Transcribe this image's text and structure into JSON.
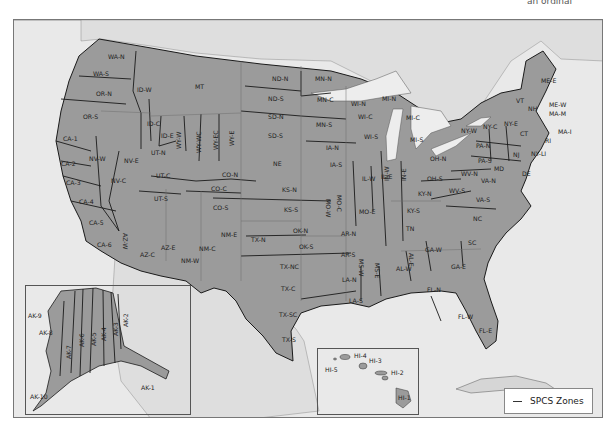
{
  "top_fragment_text": "an ordinal",
  "colors": {
    "land_us": "#9b9b9b",
    "land_foreign": "#d9d9d9",
    "water": "#e9e9e9",
    "lakes": "#efefef",
    "zone_border": "#1a1a1a",
    "state_border": "#6e6e6e"
  },
  "legend": {
    "label": "SPCS Zones"
  },
  "zones": {
    "northwest": [
      "WA-N",
      "WA-S",
      "OR-N",
      "OR-S",
      "ID-W",
      "ID-C",
      "ID-E",
      "MT"
    ],
    "california_nevada": [
      "CA-1",
      "CA-2",
      "CA-3",
      "CA-4",
      "CA-5",
      "CA-6",
      "NV-W",
      "NV-C",
      "NV-E"
    ],
    "mountain": [
      "UT-N",
      "UT-C",
      "UT-S",
      "WY-W",
      "WY-WC",
      "WY-EC",
      "WY-E",
      "CO-N",
      "CO-C",
      "CO-S",
      "AZ-W",
      "AZ-C",
      "AZ-E",
      "NM-W",
      "NM-C",
      "NM-E"
    ],
    "plains": [
      "ND-N",
      "ND-S",
      "SD-N",
      "SD-S",
      "NE",
      "KS-N",
      "KS-S",
      "OK-N",
      "OK-S",
      "TX-N",
      "TX-NC",
      "TX-C",
      "TX-SC",
      "TX-S"
    ],
    "midwest": [
      "MN-N",
      "MN-C",
      "MN-S",
      "IA-N",
      "IA-S",
      "MO-W",
      "MO-C",
      "MO-E",
      "WI-N",
      "WI-C",
      "WI-S",
      "MI-N",
      "MI-C",
      "MI-S",
      "IL-W",
      "IL-E",
      "IN-W",
      "IN-E",
      "OH-N",
      "OH-S"
    ],
    "south": [
      "AR-N",
      "AR-S",
      "LA-N",
      "LA-S",
      "MS-W",
      "MS-E",
      "AL-W",
      "AL-E",
      "GA-W",
      "GA-E",
      "FL-N",
      "FL-W",
      "FL-E",
      "TN",
      "KY-N",
      "KY-S",
      "NC",
      "SC"
    ],
    "northeast": [
      "ME-E",
      "ME-W",
      "VT",
      "NH",
      "MA-M",
      "MA-I",
      "RI",
      "CT",
      "NY-W",
      "NY-C",
      "NY-E",
      "NY-LI",
      "PA-N",
      "PA-S",
      "NJ",
      "DE",
      "MD",
      "WV-N",
      "WV-S",
      "VA-N",
      "VA-S"
    ],
    "alaska": [
      "AK-1",
      "AK-2",
      "AK-3",
      "AK-4",
      "AK-5",
      "AK-6",
      "AK-7",
      "AK-8",
      "AK-9",
      "AK-10"
    ],
    "hawaii": [
      "HI-1",
      "HI-2",
      "HI-3",
      "HI-4",
      "HI-5"
    ]
  },
  "labels": {
    "WA-N": "WA-N",
    "WA-S": "WA-S",
    "OR-N": "OR-N",
    "OR-S": "OR-S",
    "ID-W": "ID-W",
    "ID-C": "ID-C",
    "ID-E": "ID-E",
    "MT": "MT",
    "CA-1": "CA-1",
    "CA-2": "CA-2",
    "CA-3": "CA-3",
    "CA-4": "CA-4",
    "CA-5": "CA-5",
    "CA-6": "CA-6",
    "NV-W": "NV-W",
    "NV-C": "NV-C",
    "NV-E": "NV-E",
    "UT-N": "UT-N",
    "UT-C": "UT-C",
    "UT-S": "UT-S",
    "WY-W": "WY-W",
    "WY-WC": "WY-WC",
    "WY-EC": "WY-EC",
    "WY-E": "WY-E",
    "CO-N": "CO-N",
    "CO-C": "CO-C",
    "CO-S": "CO-S",
    "AZ-W": "AZ-W",
    "AZ-C": "AZ-C",
    "AZ-E": "AZ-E",
    "NM-W": "NM-W",
    "NM-C": "NM-C",
    "NM-E": "NM-E",
    "ND-N": "ND-N",
    "ND-S": "ND-S",
    "SD-N": "SD-N",
    "SD-S": "SD-S",
    "NE": "NE",
    "KS-N": "KS-N",
    "KS-S": "KS-S",
    "OK-N": "OK-N",
    "OK-S": "OK-S",
    "TX-N": "TX-N",
    "TX-NC": "TX-NC",
    "TX-C": "TX-C",
    "TX-SC": "TX-SC",
    "TX-S": "TX-S",
    "MN-N": "MN-N",
    "MN-C": "MN-C",
    "MN-S": "MN-S",
    "IA-N": "IA-N",
    "IA-S": "IA-S",
    "MO-W": "MO-W",
    "MO-C": "MO-C",
    "MO-E": "MO-E",
    "WI-N": "WI-N",
    "WI-C": "WI-C",
    "WI-S": "WI-S",
    "MI-N": "MI-N",
    "MI-C": "MI-C",
    "MI-S": "MI-S",
    "IL-W": "IL-W",
    "IL-E": "IL-E",
    "IN-W": "IN-W",
    "IN-E": "IN-E",
    "OH-N": "OH-N",
    "OH-S": "OH-S",
    "AR-N": "AR-N",
    "AR-S": "AR-S",
    "LA-N": "LA-N",
    "LA-S": "LA-S",
    "MS-W": "MS-W",
    "MS-E": "MS-E",
    "AL-W": "AL-W",
    "AL-E": "AL-E",
    "GA-W": "GA-W",
    "GA-E": "GA-E",
    "FL-N": "FL-N",
    "FL-W": "FL-W",
    "FL-E": "FL-E",
    "TN": "TN",
    "KY-N": "KY-N",
    "KY-S": "KY-S",
    "NC": "NC",
    "SC": "SC",
    "ME-E": "ME-E",
    "ME-W": "ME-W",
    "VT": "VT",
    "NH": "NH",
    "MA-M": "MA-M",
    "MA-I": "MA-I",
    "RI": "RI",
    "CT": "CT",
    "NY-W": "NY-W",
    "NY-C": "NY-C",
    "NY-E": "NY-E",
    "NY-LI": "NY-LI",
    "PA-N": "PA-N",
    "PA-S": "PA-S",
    "NJ": "NJ",
    "DE": "DE",
    "MD": "MD",
    "WV-N": "WV-N",
    "WV-S": "WV-S",
    "VA-N": "VA-N",
    "VA-S": "VA-S",
    "AK-1": "AK-1",
    "AK-2": "AK-2",
    "AK-3": "AK-3",
    "AK-4": "AK-4",
    "AK-5": "AK-5",
    "AK-6": "AK-6",
    "AK-7": "AK-7",
    "AK-8": "AK-8",
    "AK-9": "AK-9",
    "AK-10": "AK-10",
    "HI-1": "HI-1",
    "HI-2": "HI-2",
    "HI-3": "HI-3",
    "HI-4": "HI-4",
    "HI-5": "HI-5"
  }
}
